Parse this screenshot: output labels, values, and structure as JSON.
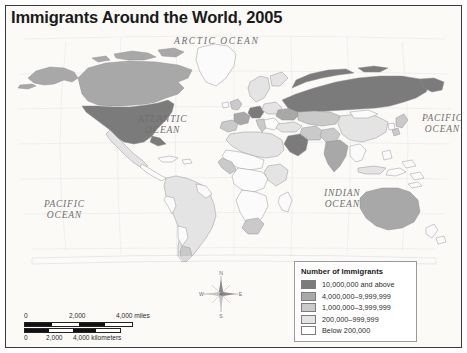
{
  "figure": {
    "title": "Immigrants Around the World, 2005",
    "projection_note": "Robinson projection",
    "background_color": "#fbfaf7",
    "frame_color": "#3a3a3a"
  },
  "ocean_labels": {
    "arctic": "ARCTIC OCEAN",
    "atlantic": "ATLANTIC\nOCEAN",
    "pacific_west": "PACIFIC\nOCEAN",
    "pacific_east": "PACIFIC\nOCEAN",
    "indian": "INDIAN\nOCEAN"
  },
  "compass": {
    "north": "N",
    "south": "S",
    "east": "E",
    "west": "W"
  },
  "legend": {
    "title": "Number of Immigrants",
    "entries": [
      {
        "label": "10,000,000 and above",
        "color": "#7b7b7b"
      },
      {
        "label": "4,000,000–9,999,999",
        "color": "#a8a8a8"
      },
      {
        "label": "1,000,000–3,999,999",
        "color": "#cacaca"
      },
      {
        "label": "200,000–999,999",
        "color": "#e4e4e4"
      },
      {
        "label": "Below 200,000",
        "color": "#ffffff"
      }
    ]
  },
  "scale": {
    "miles": {
      "ticks": [
        "0",
        "2,000",
        "4,000 miles"
      ],
      "unit": "miles"
    },
    "kilometers": {
      "ticks": [
        "0",
        "2,000",
        "4,000 kilometers"
      ],
      "unit": "kilometers"
    }
  },
  "map_data": {
    "type": "choropleth",
    "variable": "number of immigrants",
    "year": 2005,
    "classes": [
      "10,000,000 and above",
      "4,000,000–9,999,999",
      "1,000,000–3,999,999",
      "200,000–999,999",
      "Below 200,000"
    ],
    "highlighted_regions": {
      "10,000,000 and above": [
        "United States",
        "Russia",
        "Germany",
        "Saudi Arabia"
      ],
      "4,000,000–9,999,999": [
        "Canada",
        "Australia",
        "France",
        "India",
        "Ukraine"
      ],
      "1,000,000–3,999,999": [
        "Spain",
        "United Kingdom",
        "Italy",
        "Kazakhstan",
        "Pakistan",
        "Iran",
        "Japan",
        "Argentina",
        "South Africa",
        "Cote d'Ivoire"
      ],
      "200,000–999,999": [
        "Brazil",
        "Mexico",
        "China",
        "Turkey",
        "Egypt",
        "Nigeria",
        "Indonesia",
        "Sweden",
        "Netherlands"
      ],
      "Below 200,000": [
        "most of Central America",
        "most of South America",
        "most of sub-Saharan Africa",
        "Southeast Asia"
      ]
    }
  }
}
